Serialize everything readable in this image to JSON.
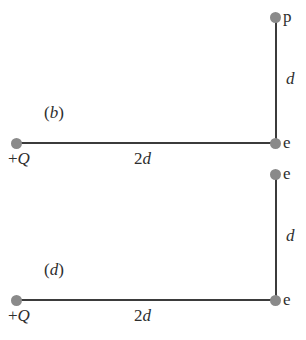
{
  "figure": {
    "kind": "physics-geometry-diagram",
    "background_color": "#ffffff",
    "line_color": "#3b3b3b",
    "node_color": "#8a8a8a",
    "text_color": "#2e2e2e"
  },
  "panels": [
    {
      "id": "b",
      "label_open_paren": "(",
      "label_letter": "b",
      "label_close_paren": ")",
      "source": {
        "charge_sign": "+",
        "charge_symbol": "Q"
      },
      "corner_node_label": "e",
      "top_node_label": "p",
      "horizontal_length_number": "2",
      "horizontal_length_symbol": "d",
      "vertical_length_symbol": "d"
    },
    {
      "id": "d",
      "label_open_paren": "(",
      "label_letter": "d",
      "label_close_paren": ")",
      "source": {
        "charge_sign": "+",
        "charge_symbol": "Q"
      },
      "corner_node_label": "e",
      "top_node_label": "e",
      "horizontal_length_number": "2",
      "horizontal_length_symbol": "d",
      "vertical_length_symbol": "d"
    }
  ]
}
